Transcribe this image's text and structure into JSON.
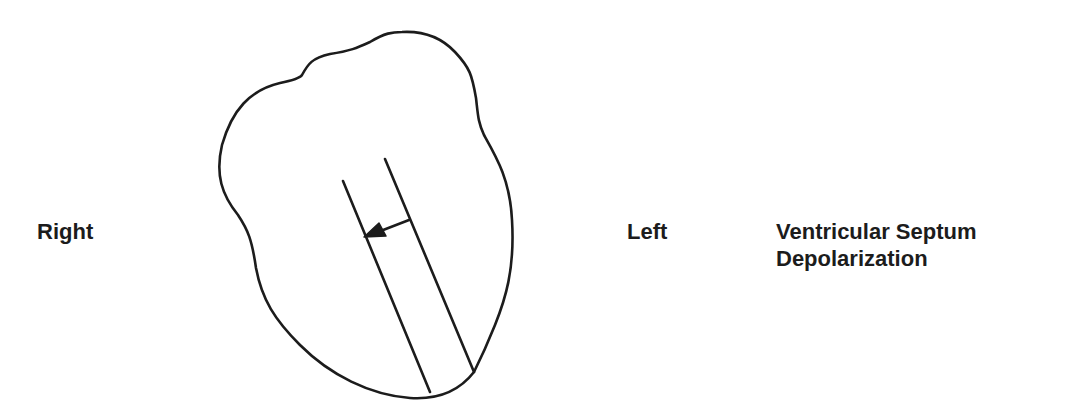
{
  "diagram": {
    "title_lines": [
      "Ventricular Septum",
      "Depolarization"
    ],
    "orientation_labels": {
      "right": "Right",
      "left": "Left"
    },
    "elements": {
      "heart_outline": "heart-outline",
      "septum": "ventricular-septum (two parallel lines)",
      "vector_arrow": "depolarization direction arrow, pointing from left wall of septum toward right"
    },
    "colors": {
      "stroke": "#1c1c1c",
      "background": "#ffffff",
      "text": "#1c1c1c"
    }
  }
}
